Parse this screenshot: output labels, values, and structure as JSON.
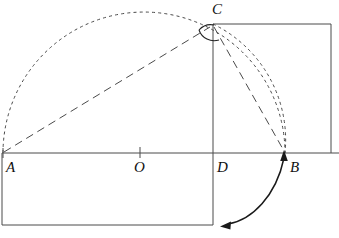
{
  "figure": {
    "type": "geometry-construction-diagram",
    "background_color": "#ffffff",
    "stroke_color": "#3a3a3a",
    "label_color": "#111111",
    "points": [
      {
        "id": "A",
        "label": "A",
        "x": 3,
        "y": 153,
        "label_x": 6,
        "label_y": 160
      },
      {
        "id": "O",
        "label": "O",
        "x": 140,
        "y": 153,
        "label_x": 134,
        "label_y": 160
      },
      {
        "id": "D",
        "label": "D",
        "x": 213,
        "y": 153,
        "label_x": 217,
        "label_y": 160
      },
      {
        "id": "B",
        "label": "B",
        "x": 285,
        "y": 153,
        "label_x": 290,
        "label_y": 160
      },
      {
        "id": "C",
        "label": "C",
        "x": 213,
        "y": 24,
        "label_x": 212,
        "label_y": 2
      }
    ],
    "segments": [
      {
        "name": "baseline-AB-extended",
        "from": "A",
        "to": "right-edge",
        "style": "solid"
      },
      {
        "name": "altitude-CD",
        "from": "C",
        "to": "D",
        "style": "solid"
      },
      {
        "name": "hypotenuse-AC",
        "from": "A",
        "to": "C",
        "style": "dashed"
      },
      {
        "name": "chord-CB",
        "from": "C",
        "to": "B",
        "style": "dashed"
      }
    ],
    "arcs": [
      {
        "name": "semicircle-on-AB",
        "center": "O",
        "radius": 141,
        "style": "fine-dashed"
      },
      {
        "name": "arc-C-to-B",
        "center": "D",
        "radius": 129,
        "style": "fine-dashed"
      },
      {
        "name": "right-angle-mark-C",
        "at": "C",
        "style": "solid"
      }
    ],
    "rectangles": [
      {
        "name": "upper-right-rectangle",
        "x": 213,
        "y": 24,
        "width": 118,
        "height": 129
      },
      {
        "name": "lower-left-rectangle",
        "x": 2,
        "y": 153,
        "width": 211,
        "height": 72
      }
    ],
    "annotations": [
      {
        "name": "fold-motion-arrow",
        "type": "double-headed-curved-arrow",
        "from_x": 224,
        "from_y": 225,
        "to_x": 285,
        "to_y": 152
      }
    ],
    "tick_marks": [
      {
        "name": "midpoint-tick-O",
        "x": 140,
        "y": 153
      }
    ]
  }
}
